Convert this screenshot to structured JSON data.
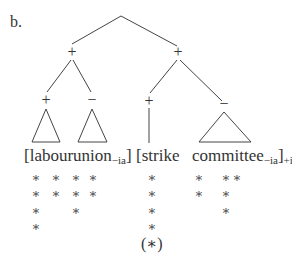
{
  "figure": {
    "label": "b.",
    "root": {
      "x": 121,
      "y": 16
    },
    "nodes": [
      {
        "id": "L",
        "sign": "+",
        "x": 72,
        "y": 52
      },
      {
        "id": "R",
        "sign": "+",
        "x": 178,
        "y": 52
      },
      {
        "id": "LL",
        "sign": "+",
        "x": 46,
        "y": 100
      },
      {
        "id": "LR",
        "sign": "−",
        "x": 92,
        "y": 100
      },
      {
        "id": "RL",
        "sign": "+",
        "x": 149,
        "y": 101
      },
      {
        "id": "RR",
        "sign": "−",
        "x": 224,
        "y": 105
      }
    ],
    "words": [
      {
        "text": "[labour",
        "sub": "",
        "sub2": "",
        "x": 24
      },
      {
        "text": "union",
        "sub": "−ia",
        "after": "]",
        "sub2": "",
        "x": 73
      },
      {
        "text": "[strike",
        "sub": "",
        "sub2": "",
        "x": 136
      },
      {
        "text": "committee",
        "sub": "−ia",
        "after": "]",
        "sub2": "+ia",
        "x": 192
      }
    ],
    "grid": {
      "columns_x": [
        36,
        56,
        76,
        93,
        152,
        199,
        226,
        237
      ],
      "rows_y": [
        177,
        193,
        210,
        226
      ],
      "stars": [
        [
          1,
          1,
          1,
          1,
          1,
          1,
          1,
          1
        ],
        [
          1,
          1,
          1,
          1,
          1,
          1,
          1,
          0
        ],
        [
          1,
          0,
          1,
          0,
          1,
          0,
          1,
          0
        ],
        [
          1,
          0,
          0,
          0,
          1,
          0,
          0,
          0
        ]
      ]
    },
    "footnote": "(∗)"
  }
}
